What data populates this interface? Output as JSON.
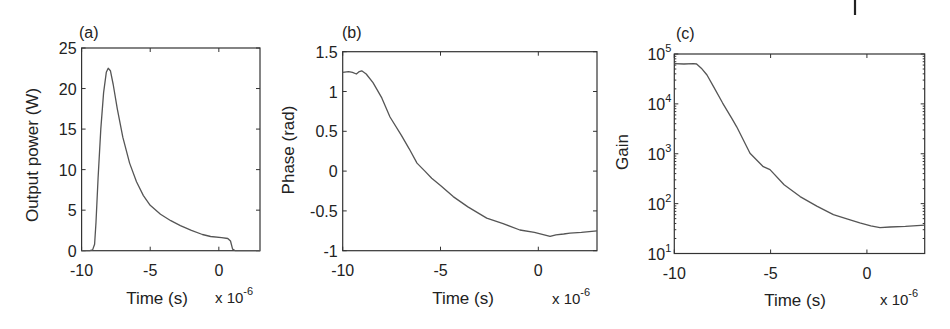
{
  "figure": {
    "panels": [
      {
        "id": "a",
        "label": "(a)",
        "ylabel": "Output power (W)",
        "xlabel": "Time (s)",
        "x_exponent_base": "x 10",
        "x_exponent_power": "-6"
      },
      {
        "id": "b",
        "label": "(b)",
        "ylabel": "Phase (rad)",
        "xlabel": "Time (s)",
        "x_exponent_base": "x 10",
        "x_exponent_power": "-6"
      },
      {
        "id": "c",
        "label": "(c)",
        "ylabel": "Gain",
        "xlabel": "Time (s)",
        "x_exponent_base": "x 10",
        "x_exponent_power": "-6"
      }
    ]
  },
  "chart_data": [
    {
      "type": "line",
      "title": "(a)",
      "xlabel": "Time (s)",
      "ylabel": "Output power (W)",
      "x_scale_note": "x 10^-6",
      "xlim": [
        -10,
        3
      ],
      "ylim": [
        0,
        25
      ],
      "xticks": [
        -10,
        -5,
        0
      ],
      "xtick_labels": [
        "-10",
        "-5",
        "0"
      ],
      "yticks": [
        0,
        5,
        10,
        15,
        20,
        25
      ],
      "ytick_labels": [
        "0",
        "5",
        "10",
        "15",
        "20",
        "25"
      ],
      "yscale": "linear",
      "grid": false,
      "series": [
        {
          "name": "Output power",
          "x": [
            -10,
            -9.4,
            -9.2,
            -9.05,
            -8.95,
            -8.8,
            -8.6,
            -8.4,
            -8.2,
            -8.06,
            -7.9,
            -7.7,
            -7.4,
            -7.0,
            -6.5,
            -6.0,
            -5.5,
            -5.0,
            -4.25,
            -3.5,
            -2.8,
            -2.0,
            -1.2,
            -0.6,
            0.2,
            0.65,
            0.85,
            1.0,
            1.2,
            3.0
          ],
          "y": [
            0,
            0,
            0.1,
            0.8,
            3.5,
            9,
            15,
            19.5,
            22,
            22.5,
            22.2,
            20.5,
            17.5,
            14,
            10.8,
            8.5,
            6.8,
            5.6,
            4.5,
            3.7,
            3.1,
            2.5,
            2.0,
            1.75,
            1.6,
            1.5,
            1.2,
            0.2,
            0,
            0
          ]
        }
      ]
    },
    {
      "type": "line",
      "title": "(b)",
      "xlabel": "Time (s)",
      "ylabel": "Phase (rad)",
      "x_scale_note": "x 10^-6",
      "xlim": [
        -10,
        3
      ],
      "ylim": [
        -1,
        1.5
      ],
      "xticks": [
        -10,
        -5,
        0
      ],
      "xtick_labels": [
        "-10",
        "-5",
        "0"
      ],
      "yticks": [
        -1,
        -0.5,
        0,
        0.5,
        1,
        1.5
      ],
      "ytick_labels": [
        "-1",
        "-0.5",
        "0",
        "0.5",
        "1",
        "1.5"
      ],
      "yscale": "linear",
      "grid": false,
      "series": [
        {
          "name": "Phase",
          "x": [
            -10,
            -9.7,
            -9.5,
            -9.3,
            -9.15,
            -9.03,
            -8.8,
            -8.45,
            -8.0,
            -7.58,
            -7.0,
            -6.6,
            -6.2,
            -5.8,
            -5.45,
            -5.0,
            -4.35,
            -3.6,
            -2.64,
            -1.8,
            -0.94,
            -0.2,
            0.3,
            0.6,
            0.9,
            1.3,
            1.62,
            2.2,
            2.6,
            3.0
          ],
          "y": [
            1.24,
            1.25,
            1.24,
            1.22,
            1.25,
            1.26,
            1.22,
            1.11,
            0.92,
            0.68,
            0.45,
            0.28,
            0.1,
            0.0,
            -0.09,
            -0.18,
            -0.32,
            -0.45,
            -0.59,
            -0.66,
            -0.74,
            -0.77,
            -0.8,
            -0.82,
            -0.8,
            -0.79,
            -0.78,
            -0.77,
            -0.76,
            -0.75
          ]
        }
      ]
    },
    {
      "type": "line",
      "title": "(c)",
      "xlabel": "Time (s)",
      "ylabel": "Gain",
      "x_scale_note": "x 10^-6",
      "xlim": [
        -10,
        3
      ],
      "ylim": [
        10,
        100000
      ],
      "xticks": [
        -10,
        -5,
        0
      ],
      "xtick_labels": [
        "-10",
        "-5",
        "0"
      ],
      "yticks": [
        10,
        100,
        1000,
        10000,
        100000
      ],
      "ytick_labels": [
        "10^1",
        "10^2",
        "10^3",
        "10^4",
        "10^5"
      ],
      "yscale": "log",
      "grid": false,
      "series": [
        {
          "name": "Gain",
          "x": [
            -10,
            -9.5,
            -9.0,
            -8.84,
            -8.6,
            -8.3,
            -7.97,
            -7.5,
            -7.0,
            -6.76,
            -6.07,
            -5.38,
            -5.03,
            -4.3,
            -3.47,
            -2.6,
            -1.74,
            -1.0,
            -0.37,
            0.2,
            0.68,
            1.2,
            2.0,
            3.0
          ],
          "y": [
            64000,
            63000,
            64000,
            63000,
            52000,
            38000,
            22400,
            10500,
            5000,
            3470,
            1020,
            550,
            480,
            240,
            138,
            89,
            60,
            49,
            41,
            36,
            33,
            34,
            35,
            37
          ]
        }
      ]
    }
  ]
}
